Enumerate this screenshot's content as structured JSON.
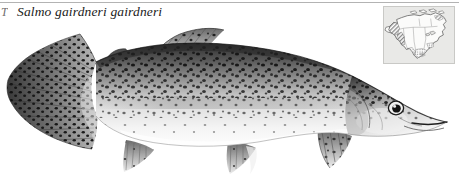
{
  "plate": {
    "letter": "T",
    "scientific_name": "Salmo gairdneri gairdneri",
    "common_subject": "rainbow-trout",
    "background_color": "#ffffff",
    "rule_color": "#9a9a9a"
  },
  "range_map": {
    "label": "North America range map",
    "panel_background": "#e9e9e7",
    "panel_border": "#c9c9c6",
    "land_fill": "#fbfbfa",
    "outline_color": "#4a4a4a",
    "range_shade_color": "#8d8d8d"
  },
  "fish": {
    "name": "rainbow-trout-illustration",
    "orientation": "facing-right",
    "body_dark": "#3a3a3a",
    "body_mid": "#9b9b9b",
    "body_light": "#f2f2f2",
    "spot_color": "#141414",
    "fin_color": "#8a8a8a",
    "parts": [
      "caudal-fin",
      "adipose-fin",
      "dorsal-fin",
      "anal-fin",
      "pelvic-fin",
      "pectoral-fin",
      "lateral-line",
      "gill-cover",
      "eye",
      "mouth"
    ]
  }
}
